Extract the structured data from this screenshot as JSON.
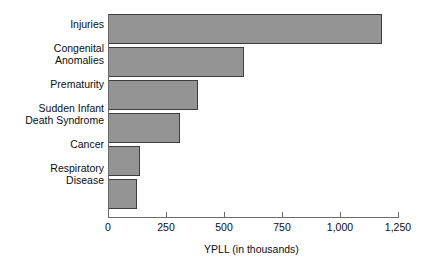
{
  "chart_data": {
    "type": "bar",
    "orientation": "horizontal",
    "title": "",
    "xlabel": "YPLL (in thousands)",
    "ylabel": "",
    "xlim": [
      0,
      1250
    ],
    "xticks": [
      0,
      250,
      500,
      750,
      1000,
      1250
    ],
    "xtick_labels": [
      "0",
      "250",
      "500",
      "750",
      "1,000",
      "1,250"
    ],
    "grid": false,
    "legend": null,
    "categories": [
      "Injuries",
      "Congenital\nAnomalies",
      "Prematurity",
      "Sudden Infant\nDeath Syndrome",
      "Cancer",
      "Respiratory\nDisease"
    ],
    "values": [
      1182,
      586,
      389,
      310,
      137,
      124
    ],
    "bar_fill_color": "#949494",
    "bar_edge_color": "#3d3d3d",
    "axis_color": "#6a6a6a",
    "background_color": "#ffffff"
  }
}
